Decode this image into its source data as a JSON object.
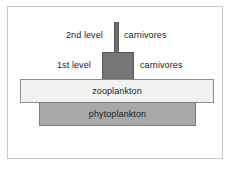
{
  "figure": {
    "type": "inverted-biomass-pyramid",
    "background_color": "#ffffff",
    "frame_color": "#c9c9c9"
  },
  "chart_data": {
    "type": "bar",
    "title": "",
    "xlabel": "",
    "ylabel": "",
    "orientation": "horizontal-centered",
    "grid": false,
    "legend": "none",
    "categories": [
      "2nd level carnivores",
      "1st level carnivores",
      "zooplankton",
      "phytoplankton"
    ],
    "values": [
      5,
      32,
      194,
      157
    ],
    "value_unit": "relative biomass (bar width, px)",
    "colors": [
      "#6e6e6e",
      "#767676",
      "#f2f2f0",
      "#a8a8a8"
    ],
    "note": "Inverted biomass pyramid: zooplankton biomass exceeds phytoplankton biomass"
  },
  "tiers": {
    "secondary_carnivores": {
      "level_label": "2nd level",
      "group_label": "carnivores",
      "fill": "#6e6e6e"
    },
    "primary_carnivores": {
      "level_label": "1st level",
      "group_label": "carnivores",
      "fill": "#767676"
    },
    "zooplankton": {
      "label": "zooplankton",
      "fill": "#f2f2f0"
    },
    "phytoplankton": {
      "label": "phytoplankton",
      "fill": "#a8a8a8"
    }
  }
}
